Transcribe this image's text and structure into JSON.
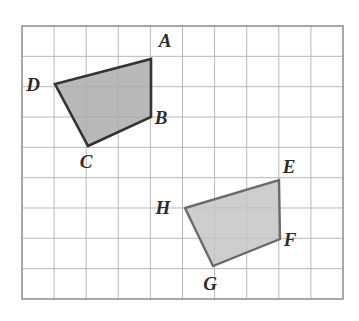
{
  "figure": {
    "kind": "geometry-grid-figure",
    "background_color": "#ffffff",
    "grid": {
      "x_start": 22,
      "y_start": 26,
      "columns": 10,
      "rows": 9,
      "cell_width": 32.1,
      "cell_height": 30.33,
      "line_color": "#b9b9b9",
      "border_color": "#9a9a9a",
      "line_width": 1,
      "border_width": 1.6,
      "grid_on": true
    },
    "shapes": [
      {
        "name": "quadrilateral-abcd",
        "label": "ABCD",
        "fill": "#a9a9a9",
        "fill_opacity": 0.82,
        "stroke": "#333333",
        "stroke_width": 2.6,
        "vertices": [
          {
            "id": "A",
            "x": 151,
            "y": 59,
            "label_x": 165,
            "label_y": 47
          },
          {
            "id": "B",
            "x": 151,
            "y": 117,
            "label_x": 161,
            "label_y": 124
          },
          {
            "id": "C",
            "x": 88,
            "y": 146,
            "label_x": 86,
            "label_y": 168
          },
          {
            "id": "D",
            "x": 55,
            "y": 84,
            "label_x": 33,
            "label_y": 91
          }
        ]
      },
      {
        "name": "quadrilateral-efgh",
        "label": "EFGH",
        "fill": "#c2c2c2",
        "fill_opacity": 0.8,
        "stroke": "#6b6b6b",
        "stroke_width": 2.4,
        "vertices": [
          {
            "id": "E",
            "x": 279,
            "y": 180,
            "label_x": 289,
            "label_y": 173
          },
          {
            "id": "F",
            "x": 280,
            "y": 239,
            "label_x": 290,
            "label_y": 246
          },
          {
            "id": "G",
            "x": 213,
            "y": 266,
            "label_x": 210,
            "label_y": 290
          },
          {
            "id": "H",
            "x": 185,
            "y": 208,
            "label_x": 163,
            "label_y": 214
          }
        ]
      }
    ]
  }
}
